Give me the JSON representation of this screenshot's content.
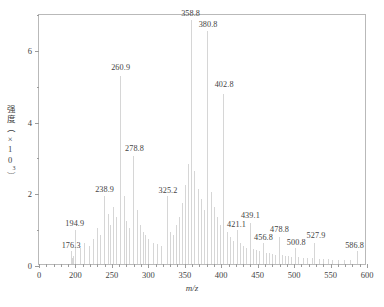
{
  "chart_data": {
    "type": "bar",
    "title": "",
    "subtitle": "",
    "xlabel": "m/z",
    "ylabel": "强度（×10³）",
    "ylabel_text": "强度（×10",
    "ylabel_exponent": "3",
    "ylabel_tail": "）",
    "grid": false,
    "legend": null,
    "xlim": [
      0,
      600
    ],
    "ylim": [
      0,
      7
    ],
    "x_tick_labels": [
      "0",
      "200",
      "250",
      "300",
      "350",
      "400",
      "450",
      "500",
      "550",
      "600"
    ],
    "x_tick_values": [
      0,
      200,
      250,
      300,
      350,
      400,
      450,
      500,
      550,
      600
    ],
    "y_tick_labels": [
      "0",
      "2",
      "4",
      "6"
    ],
    "y_tick_values": [
      0,
      2,
      4,
      6
    ],
    "y_minor_ticks": [
      1,
      3,
      5,
      7
    ],
    "categories": [
      176.3,
      194.9,
      238.9,
      260.9,
      278.8,
      325.2,
      358.8,
      380.8,
      402.8,
      421.1,
      439.1,
      456.8,
      478.8,
      500.8,
      527.9,
      586.8
    ],
    "values": [
      0.35,
      0.95,
      1.9,
      5.25,
      3.0,
      1.9,
      6.8,
      6.5,
      4.75,
      0.95,
      1.15,
      0.6,
      0.75,
      0.45,
      0.6,
      0.35
    ],
    "labels": [
      "176.3",
      "194.9",
      "238.9",
      "260.9",
      "278.8",
      "325.2",
      "358.8",
      "380.8",
      "402.8",
      "421.1",
      "439.1",
      "456.8",
      "478.8",
      "500.8",
      "527.9",
      "586.8"
    ],
    "peaks": [
      {
        "mz": "176.3",
        "intensity": 0.35,
        "label_x": 176.3,
        "label_y": 0.45
      },
      {
        "mz": "194.9",
        "intensity": 0.95,
        "label_x": 196.0,
        "label_y": 1.07
      },
      {
        "mz": "238.9",
        "intensity": 1.9,
        "label_x": 240.0,
        "label_y": 2.02
      },
      {
        "mz": "260.9",
        "intensity": 5.25,
        "label_x": 262.0,
        "label_y": 5.42
      },
      {
        "mz": "278.8",
        "intensity": 3.0,
        "label_x": 281.0,
        "label_y": 3.16
      },
      {
        "mz": "325.2",
        "intensity": 1.9,
        "label_x": 327.0,
        "label_y": 1.97
      },
      {
        "mz": "358.8",
        "intensity": 6.8,
        "label_x": 358.0,
        "label_y": 6.93
      },
      {
        "mz": "380.8",
        "intensity": 6.5,
        "label_x": 382.0,
        "label_y": 6.62
      },
      {
        "mz": "402.8",
        "intensity": 4.75,
        "label_x": 404.0,
        "label_y": 4.93
      },
      {
        "mz": "421.1",
        "intensity": 0.95,
        "label_x": 421.0,
        "label_y": 1.03
      },
      {
        "mz": "439.1",
        "intensity": 1.15,
        "label_x": 440.0,
        "label_y": 1.27
      },
      {
        "mz": "456.8",
        "intensity": 0.6,
        "label_x": 458.0,
        "label_y": 0.68
      },
      {
        "mz": "478.8",
        "intensity": 0.75,
        "label_x": 480.0,
        "label_y": 0.88
      },
      {
        "mz": "500.8",
        "intensity": 0.45,
        "label_x": 503.0,
        "label_y": 0.52
      },
      {
        "mz": "527.9",
        "intensity": 0.6,
        "label_x": 530.0,
        "label_y": 0.72
      },
      {
        "mz": "586.8",
        "intensity": 0.35,
        "label_x": 583.0,
        "label_y": 0.45
      }
    ],
    "minor_peaks_mz": [
      182,
      188,
      200,
      206,
      212,
      218,
      224,
      230,
      234,
      244,
      248,
      252,
      256,
      266,
      270,
      274,
      284,
      288,
      292,
      296,
      300,
      306,
      312,
      318,
      330,
      334,
      338,
      342,
      346,
      350,
      354,
      363,
      368,
      372,
      376,
      386,
      390,
      394,
      398,
      408,
      412,
      416,
      426,
      430,
      434,
      444,
      448,
      452,
      462,
      466,
      470,
      474,
      484,
      488,
      492,
      496,
      506,
      512,
      518,
      524,
      534,
      540,
      546,
      552,
      560,
      568,
      576
    ],
    "minor_peaks_intensity": [
      0.18,
      0.22,
      0.3,
      0.45,
      0.6,
      0.5,
      0.7,
      1.0,
      0.8,
      1.4,
      1.1,
      1.6,
      1.3,
      1.9,
      1.2,
      1.0,
      1.5,
      1.1,
      0.9,
      0.8,
      0.7,
      0.6,
      0.55,
      0.5,
      0.9,
      0.8,
      1.1,
      1.3,
      1.7,
      2.2,
      2.8,
      2.6,
      2.1,
      1.8,
      1.5,
      2.0,
      1.6,
      1.3,
      1.1,
      0.9,
      0.75,
      0.65,
      0.6,
      0.5,
      0.45,
      0.42,
      0.38,
      0.35,
      0.32,
      0.3,
      0.28,
      0.26,
      0.25,
      0.23,
      0.22,
      0.2,
      0.2,
      0.18,
      0.17,
      0.16,
      0.15,
      0.14,
      0.13,
      0.12,
      0.11,
      0.1,
      0.1
    ]
  },
  "colors": {
    "peak": "#d6d6d6",
    "axis": "#b9b9b9",
    "text": "#444444",
    "background": "#ffffff"
  }
}
